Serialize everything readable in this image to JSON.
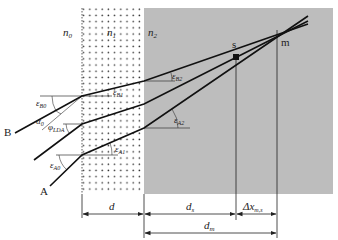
{
  "diagram": {
    "media": {
      "n0": "n",
      "n0_sub": "0",
      "n1": "n",
      "n1_sub": "1",
      "n2": "n",
      "n2_sub": "2",
      "layer1_fill": "dotted",
      "layer2_color": "#bdbdbd"
    },
    "rays": [
      {
        "name": "B",
        "label": "B"
      },
      {
        "name": "middle",
        "label": ""
      },
      {
        "name": "A",
        "label": "A"
      }
    ],
    "points": {
      "s": "s",
      "m": "m"
    },
    "angles": {
      "eps_B0": "ε",
      "eps_B0_sub": "B0",
      "eps_B1": "ε",
      "eps_B1_sub": "B1",
      "eps_B2": "ε",
      "eps_B2_sub": "B2",
      "eps_A0": "ε",
      "eps_A0_sub": "A0",
      "eps_A1": "ε",
      "eps_A1_sub": "A1",
      "eps_A2": "ε",
      "eps_A2_sub": "A2",
      "alpha0": "α",
      "alpha0_sub": "0",
      "phi_LDA": "φ",
      "phi_LDA_sub": "LDA"
    },
    "dimensions": {
      "d": "d",
      "ds": "d",
      "ds_sub": "s",
      "dx": "Δx",
      "dx_sub": "m,s",
      "dm": "d",
      "dm_sub": "m"
    }
  }
}
